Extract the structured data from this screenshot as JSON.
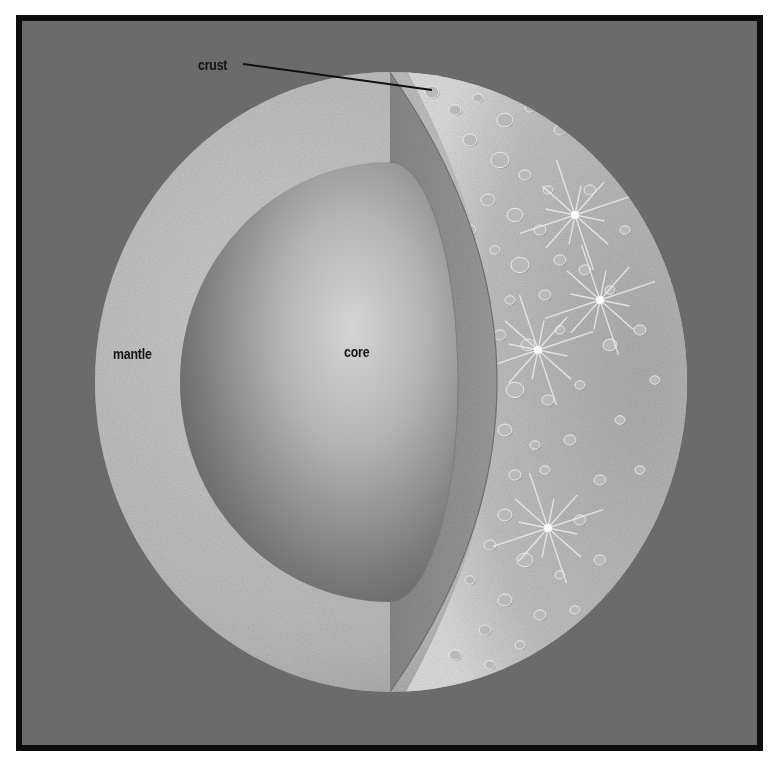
{
  "diagram": {
    "labels": {
      "crust": "crust",
      "mantle": "mantle",
      "core": "core"
    },
    "colors": {
      "frame_border": "#0d0d0d",
      "background": "#6b6b6b",
      "mantle_light": "#c4c4c4",
      "mantle_shadow": "#9a9a9a",
      "cut_plane": "#8f8f8f",
      "core_highlight": "#d2d2d2",
      "core_shadow": "#555555",
      "surface_light": "#d8d8d8",
      "surface_mid": "#a8a8a8",
      "label_text": "#141414",
      "leader_line": "#111111"
    },
    "geometry": {
      "sphere": {
        "cx": 391,
        "cy": 382,
        "rx": 296,
        "ry": 310
      },
      "cut_x": 390,
      "crust_edge_max_x": 497,
      "core": {
        "cx": 390,
        "cy": 382,
        "rx_left": 210,
        "rx_right": 68,
        "ry": 220
      },
      "crust_leader": {
        "x1": 243,
        "y1": 64,
        "x2": 432,
        "y2": 90
      }
    },
    "craters": [
      [
        432,
        92,
        7
      ],
      [
        455,
        110,
        6
      ],
      [
        478,
        98,
        5
      ],
      [
        505,
        120,
        8
      ],
      [
        530,
        108,
        5
      ],
      [
        560,
        130,
        6
      ],
      [
        470,
        140,
        7
      ],
      [
        500,
        160,
        9
      ],
      [
        525,
        175,
        6
      ],
      [
        548,
        190,
        5
      ],
      [
        488,
        200,
        7
      ],
      [
        515,
        215,
        8
      ],
      [
        470,
        230,
        6
      ],
      [
        540,
        230,
        6
      ],
      [
        495,
        250,
        5
      ],
      [
        520,
        265,
        9
      ],
      [
        560,
        260,
        6
      ],
      [
        480,
        285,
        7
      ],
      [
        510,
        300,
        5
      ],
      [
        545,
        295,
        6
      ],
      [
        585,
        270,
        6
      ],
      [
        470,
        320,
        8
      ],
      [
        500,
        335,
        6
      ],
      [
        528,
        345,
        7
      ],
      [
        560,
        330,
        5
      ],
      [
        610,
        345,
        7
      ],
      [
        488,
        370,
        5
      ],
      [
        515,
        390,
        9
      ],
      [
        548,
        400,
        6
      ],
      [
        580,
        385,
        5
      ],
      [
        470,
        410,
        6
      ],
      [
        505,
        430,
        7
      ],
      [
        535,
        445,
        5
      ],
      [
        570,
        440,
        6
      ],
      [
        620,
        420,
        5
      ],
      [
        482,
        460,
        8
      ],
      [
        515,
        475,
        6
      ],
      [
        545,
        470,
        5
      ],
      [
        600,
        480,
        6
      ],
      [
        475,
        500,
        5
      ],
      [
        505,
        515,
        7
      ],
      [
        580,
        520,
        6
      ],
      [
        640,
        470,
        5
      ],
      [
        490,
        545,
        6
      ],
      [
        525,
        560,
        8
      ],
      [
        560,
        575,
        5
      ],
      [
        600,
        560,
        6
      ],
      [
        470,
        580,
        5
      ],
      [
        505,
        600,
        7
      ],
      [
        540,
        615,
        6
      ],
      [
        575,
        610,
        5
      ],
      [
        485,
        630,
        6
      ],
      [
        520,
        645,
        5
      ],
      [
        455,
        655,
        6
      ],
      [
        490,
        665,
        5
      ],
      [
        610,
        290,
        5
      ],
      [
        640,
        330,
        6
      ],
      [
        655,
        380,
        5
      ],
      [
        625,
        230,
        5
      ],
      [
        590,
        190,
        6
      ]
    ],
    "ray_craters": [
      [
        548,
        528
      ],
      [
        538,
        350
      ],
      [
        600,
        300
      ],
      [
        575,
        215
      ]
    ]
  }
}
